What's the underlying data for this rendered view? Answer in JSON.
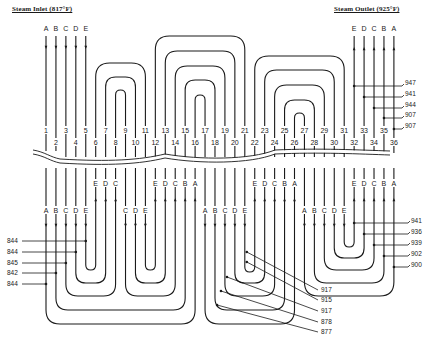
{
  "titles": {
    "inlet": "Steam Inlet (817°F)",
    "outlet": "Steam Outlet (925°F)"
  },
  "colors": {
    "line": "#1a1a1a",
    "background": "#ffffff"
  },
  "tube_numbers": [
    "1",
    "2",
    "3",
    "4",
    "5",
    "6",
    "7",
    "8",
    "9",
    "10",
    "11",
    "12",
    "13",
    "14",
    "15",
    "16",
    "17",
    "18",
    "19",
    "20",
    "21",
    "22",
    "23",
    "24",
    "25",
    "26",
    "27",
    "28",
    "29",
    "30",
    "31",
    "32",
    "33",
    "34",
    "35",
    "36"
  ],
  "inlet_letters": [
    "A",
    "B",
    "C",
    "D",
    "E"
  ],
  "outlet_letters": [
    "E",
    "D",
    "C",
    "B",
    "A"
  ],
  "break_letters": [
    {
      "col": 6,
      "label": "E"
    },
    {
      "col": 7,
      "label": "D"
    },
    {
      "col": 8,
      "label": "C"
    },
    {
      "col": 12,
      "label": "E"
    },
    {
      "col": 13,
      "label": "D"
    },
    {
      "col": 14,
      "label": "C"
    },
    {
      "col": 15,
      "label": "B"
    },
    {
      "col": 16,
      "label": "A"
    },
    {
      "col": 22,
      "label": "E"
    },
    {
      "col": 23,
      "label": "D"
    },
    {
      "col": 24,
      "label": "C"
    },
    {
      "col": 25,
      "label": "B"
    },
    {
      "col": 26,
      "label": "A"
    },
    {
      "col": 32,
      "label": "E"
    },
    {
      "col": 33,
      "label": "D"
    },
    {
      "col": 34,
      "label": "C"
    },
    {
      "col": 35,
      "label": "B"
    },
    {
      "col": 36,
      "label": "A"
    }
  ],
  "lower_letters": [
    {
      "col": 1,
      "label": "A"
    },
    {
      "col": 2,
      "label": "B"
    },
    {
      "col": 3,
      "label": "C"
    },
    {
      "col": 4,
      "label": "D"
    },
    {
      "col": 5,
      "label": "E"
    },
    {
      "col": 9,
      "label": "C"
    },
    {
      "col": 10,
      "label": "D"
    },
    {
      "col": 11,
      "label": "E"
    },
    {
      "col": 17,
      "label": "A"
    },
    {
      "col": 18,
      "label": "B"
    },
    {
      "col": 19,
      "label": "C"
    },
    {
      "col": 20,
      "label": "D"
    },
    {
      "col": 21,
      "label": "E"
    },
    {
      "col": 27,
      "label": "A"
    },
    {
      "col": 28,
      "label": "B"
    },
    {
      "col": 29,
      "label": "C"
    },
    {
      "col": 30,
      "label": "D"
    },
    {
      "col": 31,
      "label": "E"
    }
  ],
  "temperatures": {
    "outlet_right": [
      "947",
      "941",
      "944",
      "907",
      "907"
    ],
    "lower_right": [
      "941",
      "936",
      "939",
      "902",
      "900"
    ],
    "lower_left": [
      "844",
      "844",
      "845",
      "842",
      "844"
    ],
    "bottom_center": [
      "917",
      "915",
      "917",
      "878",
      "877"
    ]
  }
}
